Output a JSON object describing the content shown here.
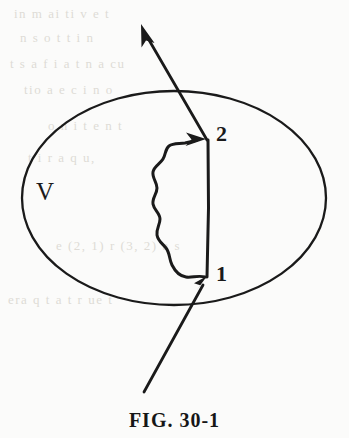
{
  "figure": {
    "caption": "FIG. 30-1",
    "stroke_color": "#1a1a1a",
    "background_color": "#fbfbfa",
    "labels": {
      "region": "V",
      "point_start": "1",
      "point_end": "2"
    },
    "elements": {
      "boundary_name": "volume-boundary-ellipse",
      "incoming_ray_name": "incoming-particle-ray",
      "outgoing_ray_name": "outgoing-particle-ray",
      "chord_name": "straight-world-line-segment",
      "wavy_name": "wavy-photon-line"
    }
  },
  "bleed_through": {
    "lines": [
      {
        "text": "in   m   ai   ti   v  e   t",
        "x": 14,
        "y": 6
      },
      {
        "text": "n    s   o    t    t   i   n",
        "x": 20,
        "y": 30
      },
      {
        "text": "t   s  a   f   i   a   t  n   a  cu",
        "x": 10,
        "y": 56
      },
      {
        "text": "tio    a   e   c  i  n    o",
        "x": 24,
        "y": 82
      },
      {
        "text": "o   n   i   t  e   n   t",
        "x": 48,
        "y": 118
      },
      {
        "text": "t    i    r   a   q   u,",
        "x": 28,
        "y": 150
      },
      {
        "text": "e   (2, 1)    r   (3, 2)   a   s",
        "x": 56,
        "y": 238
      },
      {
        "text": "era   q    t   a   t    r   ue  t",
        "x": 8,
        "y": 292
      }
    ]
  }
}
